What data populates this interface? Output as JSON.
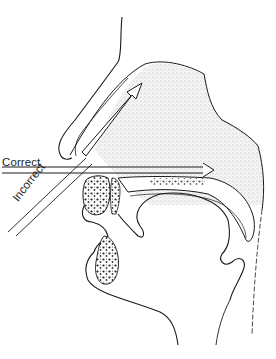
{
  "diagram": {
    "labels": {
      "correct": "Correct",
      "incorrect": "Incorrect"
    },
    "arrows": [
      {
        "name": "correct-direction-arrow",
        "direction": "horizontal, straight back along nasal floor"
      },
      {
        "name": "incorrect-direction-arrow",
        "direction": "upward toward upper nasal cavity"
      }
    ],
    "colors": {
      "line": "#1a1a1a",
      "stipple": "#9a9a9a",
      "background": "#ffffff"
    }
  }
}
